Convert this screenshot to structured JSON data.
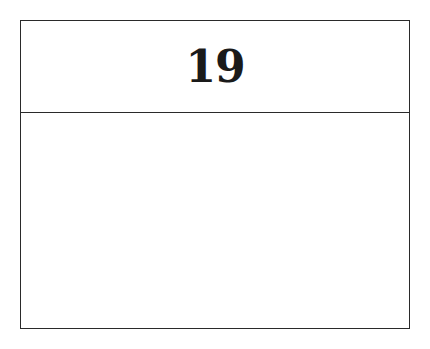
{
  "card": {
    "header_number": "19",
    "body_text": ""
  }
}
